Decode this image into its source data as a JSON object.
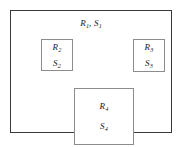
{
  "figure": {
    "background_color": "#ffffff",
    "outer_border_color": "#3a3a3a",
    "inner_border_color": "#8c8c8c",
    "text_color": "#1a1a1a"
  },
  "regions": {
    "outer": {
      "name": "region-1",
      "label_region": "R",
      "label_region_sub": "1",
      "separator": ", ",
      "label_set": "S",
      "label_set_sub": "1"
    },
    "inner": [
      {
        "name": "region-2",
        "label_region": "R",
        "label_region_sub": "2",
        "label_set": "S",
        "label_set_sub": "2"
      },
      {
        "name": "region-3",
        "label_region": "R",
        "label_region_sub": "3",
        "label_set": "S",
        "label_set_sub": "3"
      },
      {
        "name": "region-4",
        "label_region": "R",
        "label_region_sub": "4",
        "label_set": "S",
        "label_set_sub": "4"
      }
    ]
  }
}
